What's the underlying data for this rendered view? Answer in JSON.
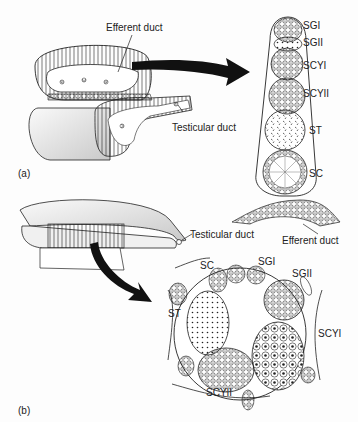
{
  "figure": {
    "panel_a": {
      "label": "(a)",
      "callouts": {
        "efferent_duct": "Efferent duct",
        "testicular_duct": "Testicular duct"
      },
      "cyst_stages": [
        "SGI",
        "SGII",
        "SCYI",
        "SCYII",
        "ST",
        "SC"
      ],
      "bottom_callout": "Efferent duct"
    },
    "panel_b": {
      "label": "(b)",
      "callouts": {
        "testicular_duct": "Testicular duct",
        "sc": "SC",
        "sgi": "SGI",
        "sgii": "SGII",
        "st": "ST",
        "scyi": "SCYI",
        "scyii": "SCYII"
      }
    },
    "colors": {
      "ink": "#222222",
      "background": "#fdfdfd",
      "arrow": "#111111"
    }
  }
}
